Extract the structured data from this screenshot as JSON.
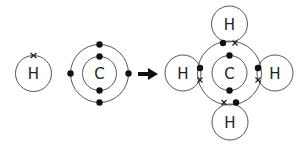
{
  "diagram": {
    "reactants": {
      "hydrogen": {
        "symbol": "H",
        "electron_marker": "cross",
        "electrons": 1
      },
      "carbon": {
        "symbol": "C",
        "inner_shell_electrons": 2,
        "outer_shell_electrons": 4,
        "electron_marker": "dot"
      }
    },
    "arrow": {
      "direction": "right",
      "color": "#111111"
    },
    "product": {
      "center": {
        "symbol": "C"
      },
      "bonded_atoms": [
        {
          "position": "top",
          "symbol": "H"
        },
        {
          "position": "left",
          "symbol": "H"
        },
        {
          "position": "right",
          "symbol": "H"
        },
        {
          "position": "bottom",
          "symbol": "H"
        }
      ],
      "shared_pairs": 4
    },
    "colors": {
      "stroke": "#555555",
      "electron": "#111111",
      "background": "#ffffff"
    }
  }
}
